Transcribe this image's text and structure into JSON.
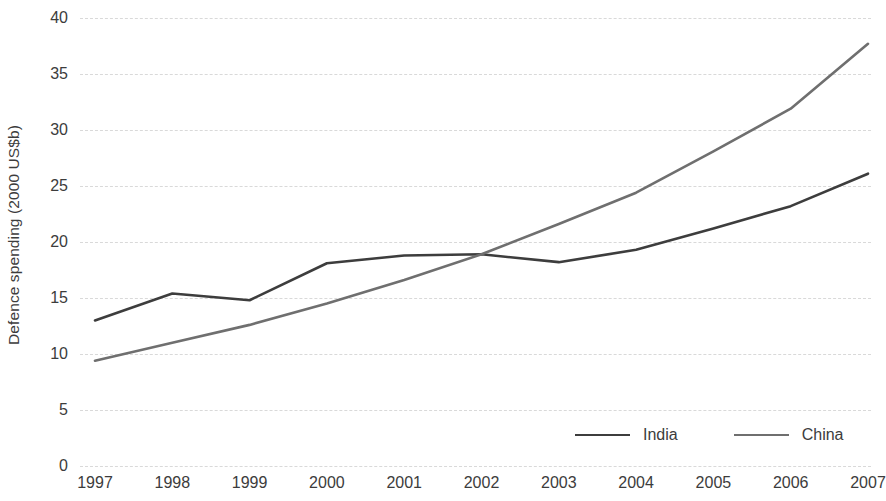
{
  "chart_data": {
    "type": "line",
    "title": "",
    "xlabel": "",
    "ylabel": "Defence spending (2000 US$b)",
    "x": [
      "1997",
      "1998",
      "1999",
      "2000",
      "2001",
      "2002",
      "2003",
      "2004",
      "2005",
      "2006",
      "2007"
    ],
    "categories": [
      "1997",
      "1998",
      "1999",
      "2000",
      "2001",
      "2002",
      "2003",
      "2004",
      "2005",
      "2006",
      "2007"
    ],
    "series": [
      {
        "name": "India",
        "color": "#3d3d3d",
        "values": [
          13.0,
          15.4,
          14.8,
          18.1,
          18.8,
          18.9,
          18.2,
          19.3,
          21.2,
          23.2,
          26.1
        ]
      },
      {
        "name": "China",
        "color": "#6f6f6f",
        "values": [
          9.4,
          11.0,
          12.6,
          14.5,
          16.6,
          18.9,
          21.6,
          24.4,
          28.1,
          31.9,
          37.7
        ]
      }
    ],
    "ylim": [
      0,
      40
    ],
    "yticks": [
      0,
      5,
      10,
      15,
      20,
      25,
      30,
      35,
      40
    ],
    "ytick_labels": [
      "0",
      "5",
      "10",
      "15",
      "20",
      "25",
      "30",
      "35",
      "40"
    ],
    "grid": "horizontal-dashed",
    "grid_color": "#d9d9d9",
    "legend_position": "bottom-right",
    "legend": [
      "India",
      "China"
    ]
  }
}
